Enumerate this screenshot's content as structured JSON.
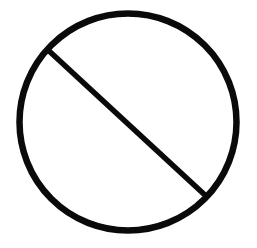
{
  "figure": {
    "label": "Prohibition sign (circle with diagonal slash)",
    "icon": "prohibited-icon",
    "background": "#ffffff",
    "stroke_color": "#0a0a0a",
    "circle": {
      "cx": 128,
      "cy": 122,
      "r": 108.5,
      "stroke_width": 6.5
    },
    "slash": {
      "x1": 48,
      "y1": 50,
      "x2": 206,
      "y2": 196,
      "stroke_width": 5.5
    }
  }
}
